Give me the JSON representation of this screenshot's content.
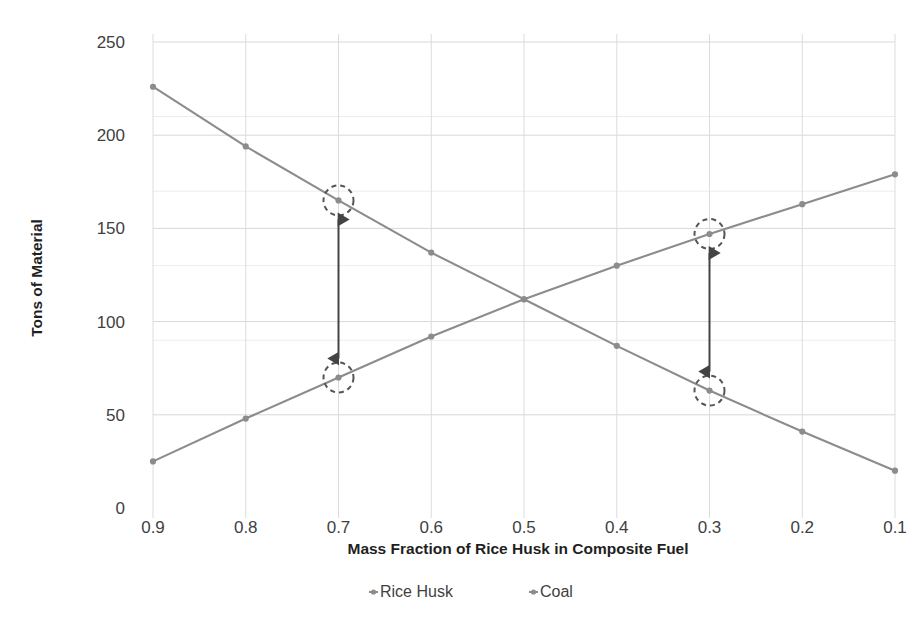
{
  "chart_data": {
    "type": "line",
    "title": "",
    "xlabel": "Mass Fraction of Rice Husk in Composite Fuel",
    "ylabel": "Tons of Material",
    "categories": [
      "0.9",
      "0.8",
      "0.7",
      "0.6",
      "0.5",
      "0.4",
      "0.3",
      "0.2",
      "0.1"
    ],
    "x_tick_labels": [
      "0.9",
      "0.8",
      "0.7",
      "0.6",
      "0.5",
      "0.4",
      "0.3",
      "0.2",
      "0.1"
    ],
    "y_tick_labels": [
      "0",
      "50",
      "100",
      "150",
      "200",
      "250"
    ],
    "y_tick_values": [
      0,
      50,
      100,
      150,
      200,
      250
    ],
    "ylim": [
      0,
      250
    ],
    "grid": "horizontal-and-vertical",
    "legend_position": "bottom",
    "series": [
      {
        "name": "Rice Husk",
        "color": "#8c8c8c",
        "values": [
          226,
          194,
          165,
          137,
          112,
          87,
          63,
          41,
          20
        ]
      },
      {
        "name": "Coal",
        "color": "#8c8c8c",
        "values": [
          25,
          48,
          70,
          92,
          112,
          130,
          147,
          163,
          179
        ]
      }
    ],
    "annotations": [
      {
        "name": "gap-callout-0.7",
        "type": "double-arrow-with-circles",
        "x_category": "0.7",
        "y_top": 165,
        "y_bottom": 70
      },
      {
        "name": "gap-callout-0.3",
        "type": "double-arrow-with-circles",
        "x_category": "0.3",
        "y_top": 147,
        "y_bottom": 63
      }
    ]
  },
  "legend": {
    "items": [
      {
        "label": "Rice Husk",
        "color": "#8c8c8c"
      },
      {
        "label": "Coal",
        "color": "#8c8c8c"
      }
    ]
  },
  "colors": {
    "series": "#8c8c8c",
    "gridline": "#d8d8d8",
    "annotation": "#555555",
    "text": "#3f3f3f"
  }
}
